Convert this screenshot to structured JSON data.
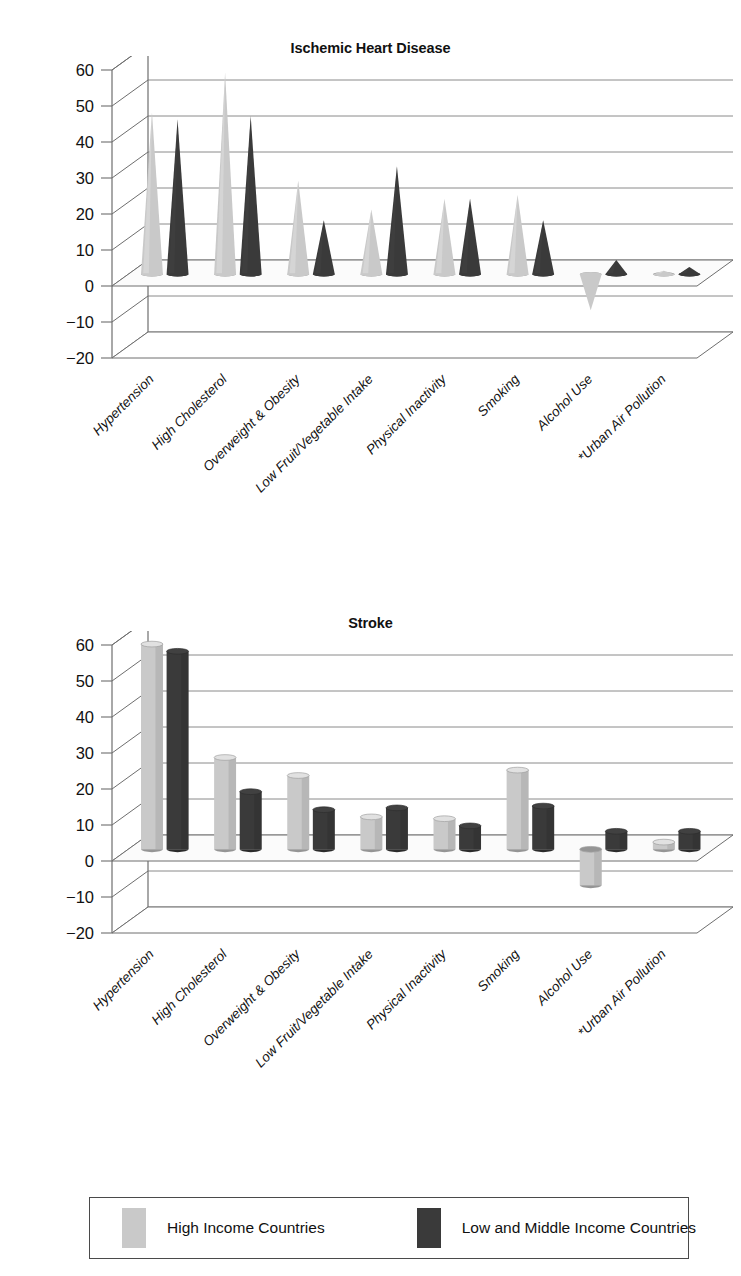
{
  "colors": {
    "high_income": "#c9c9c9",
    "low_middle_income": "#3a3a3a",
    "high_income_shade": "#b4b4b4",
    "low_middle_shade": "#262626",
    "grid": "#8a8a8a",
    "axis": "#6e6e6e",
    "floor": "#fbfbfb",
    "text": "#111111"
  },
  "legend": {
    "entries": [
      {
        "label": "High Income Countries",
        "color": "#c9c9c9",
        "icon": "legend-swatch-light"
      },
      {
        "label": "Low and Middle Income Countries",
        "color": "#3a3a3a",
        "icon": "legend-swatch-dark"
      }
    ]
  },
  "chart_data": [
    {
      "type": "bar",
      "shape": "cone",
      "title": "Ischemic Heart Disease",
      "xlabel": "",
      "ylabel": "",
      "ylim": [
        -20,
        60
      ],
      "yticks": [
        60,
        50,
        40,
        30,
        20,
        10,
        0,
        -10,
        -20
      ],
      "ytick_labels": [
        "60",
        "50",
        "40",
        "30",
        "20",
        "10",
        "0",
        "−10",
        "−20"
      ],
      "grid": true,
      "legend_position": "bottom",
      "categories": [
        "Hypertension",
        "High Cholesterol",
        "Overweight & Obesity",
        "Low Fruit/Vegetable Intake",
        "Physical Inactivity",
        "Smoking",
        "Alcohol Use",
        "*Urban Air Pollution"
      ],
      "series": [
        {
          "name": "High Income Countries",
          "color": "#c9c9c9",
          "values": [
            45,
            56,
            26,
            18,
            21,
            22,
            -10,
            1
          ]
        },
        {
          "name": "Low and Middle Income Countries",
          "color": "#3a3a3a",
          "values": [
            43,
            44,
            15,
            30,
            21,
            15,
            4,
            2
          ]
        }
      ]
    },
    {
      "type": "bar",
      "shape": "cylinder",
      "title": "Stroke",
      "xlabel": "",
      "ylabel": "",
      "ylim": [
        -20,
        60
      ],
      "yticks": [
        60,
        50,
        40,
        30,
        20,
        10,
        0,
        -10,
        -20
      ],
      "ytick_labels": [
        "60",
        "50",
        "40",
        "30",
        "20",
        "10",
        "0",
        "−10",
        "−20"
      ],
      "grid": true,
      "legend_position": "bottom",
      "categories": [
        "Hypertension",
        "High Cholesterol",
        "Overweight & Obesity",
        "Low Fruit/Vegetable Intake",
        "Physical Inactivity",
        "Smoking",
        "Alcohol Use",
        "*Urban Air Pollution"
      ],
      "series": [
        {
          "name": "High Income Countries",
          "color": "#c9c9c9",
          "values": [
            57,
            25.5,
            20.5,
            9,
            8.5,
            22,
            -10,
            2
          ]
        },
        {
          "name": "Low and Middle Income Countries",
          "color": "#3a3a3a",
          "values": [
            55,
            16,
            11,
            11.5,
            6.5,
            12,
            5,
            5
          ]
        }
      ]
    }
  ]
}
